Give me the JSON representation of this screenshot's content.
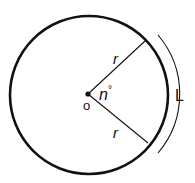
{
  "diagram": {
    "type": "circle-sector-arc",
    "labels": {
      "radius_upper": "r",
      "radius_lower": "r",
      "angle": "n°",
      "angle_symbol": "n",
      "degree_mark": "°",
      "center": "o",
      "arc_length": "L"
    },
    "colors": {
      "stroke": "#111111",
      "background": "#ffffff"
    }
  }
}
